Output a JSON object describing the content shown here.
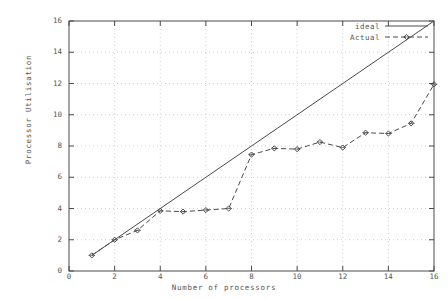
{
  "chart_data": {
    "type": "line",
    "title": "",
    "xlabel": "Number of processors",
    "ylabel": "Processor Utilisation",
    "xlim": [
      0,
      16
    ],
    "ylim": [
      0,
      16
    ],
    "xticks": [
      "0",
      "2",
      "4",
      "6",
      "8",
      "10",
      "12",
      "14",
      "16"
    ],
    "yticks": [
      "0",
      "2",
      "4",
      "6",
      "8",
      "10",
      "12",
      "14",
      "16"
    ],
    "grid": true,
    "legend_position": "top-right",
    "series": [
      {
        "name": "ideal",
        "style": "solid",
        "marker": "none",
        "color": "#4a4a4a",
        "x": [
          1,
          16
        ],
        "values": [
          1,
          16
        ]
      },
      {
        "name": "Actual",
        "style": "dashed",
        "marker": "diamond",
        "color": "#4a4a4a",
        "x": [
          1,
          2,
          3,
          4,
          5,
          6,
          7,
          8,
          9,
          10,
          11,
          12,
          13,
          14,
          15,
          16
        ],
        "values": [
          1.0,
          2.0,
          2.6,
          3.85,
          3.8,
          3.9,
          4.0,
          7.45,
          7.85,
          7.8,
          8.25,
          7.9,
          8.85,
          8.8,
          9.45,
          11.95
        ]
      }
    ]
  },
  "axes": {
    "x_label": "Number of processors",
    "y_label": "Processor Utilisation",
    "x_ticks": [
      "0",
      "2",
      "4",
      "6",
      "8",
      "10",
      "12",
      "14",
      "16"
    ],
    "y_ticks": [
      "0",
      "2",
      "4",
      "6",
      "8",
      "10",
      "12",
      "14",
      "16"
    ]
  },
  "legend": {
    "entries": [
      {
        "label": "ideal"
      },
      {
        "label": "Actual"
      }
    ]
  },
  "colors": {
    "axis": "#4a4a4a",
    "grid": "#bdbdbd",
    "ideal_line": "#4a4a4a",
    "actual_line": "#4a4a4a",
    "background": "#ffffff"
  }
}
